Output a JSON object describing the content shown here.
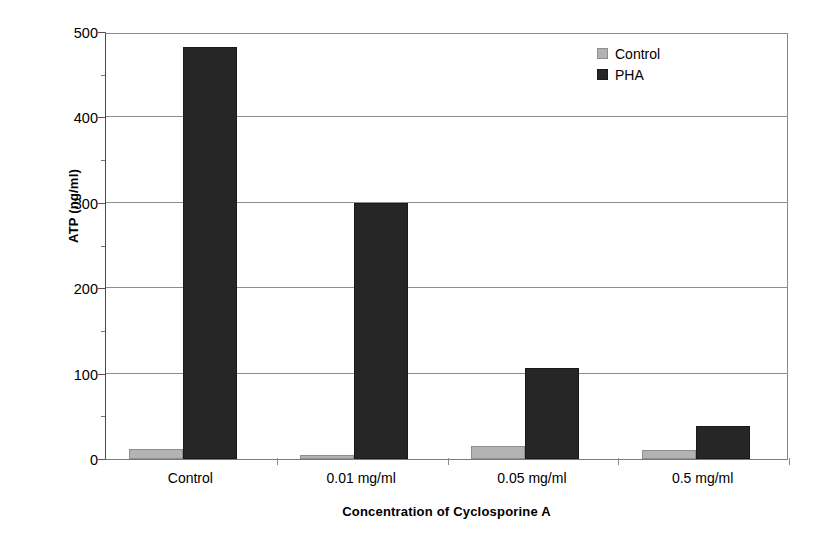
{
  "chart_data": {
    "type": "bar",
    "title": "",
    "xlabel": "Concentration of Cyclosporine A",
    "ylabel": "ATP (ng/ml)",
    "categories": [
      "Control",
      "0.01 mg/ml",
      "0.05 mg/ml",
      "0.5 mg/ml"
    ],
    "series": [
      {
        "name": "Control",
        "color": "#b3b3b3",
        "values": [
          12,
          5,
          15,
          10
        ]
      },
      {
        "name": "PHA",
        "color": "#262626",
        "values": [
          482,
          300,
          106,
          39
        ]
      }
    ],
    "ylim": [
      0,
      500
    ],
    "yticks": [
      0,
      100,
      200,
      300,
      400,
      500
    ],
    "ytick_labels": [
      "0",
      "100",
      "200",
      "300",
      "400",
      "500"
    ],
    "grid": "horizontal",
    "legend_position": "top-right-inside",
    "legend_entries": [
      "Control",
      "PHA"
    ]
  },
  "axes": {
    "y_title": "ATP (ng/ml)",
    "x_title": "Concentration of Cyclosporine A"
  },
  "colors": {
    "control": "#b3b3b3",
    "pha": "#262626",
    "gridline": "#8e8e8e",
    "axis": "#4a4a4a",
    "background": "#ffffff"
  }
}
